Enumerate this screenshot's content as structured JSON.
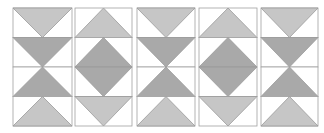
{
  "diagram": {
    "title": "",
    "colors": {
      "background": "#ffffff",
      "light": "#c6c6c6",
      "dark": "#a9a9a9",
      "stroke": "#9a9a9a",
      "frame": "#a0a0a0"
    },
    "row_top": 8,
    "row_height": 29.5,
    "columns": [
      {
        "x": 13,
        "w": 59,
        "tiles": [
          "down-light",
          "down-dark",
          "up-dark",
          "up-light"
        ]
      },
      {
        "x": 75,
        "w": 57,
        "tiles": [
          "up-light",
          "up-dark",
          "down-dark",
          "down-light"
        ]
      },
      {
        "x": 137,
        "w": 58,
        "tiles": [
          "down-light",
          "down-dark",
          "up-dark",
          "up-light"
        ]
      },
      {
        "x": 199,
        "w": 58,
        "tiles": [
          "up-light",
          "up-dark",
          "down-dark",
          "down-light"
        ]
      },
      {
        "x": 261,
        "w": 57,
        "tiles": [
          "down-light",
          "down-dark",
          "up-dark",
          "up-light"
        ]
      }
    ]
  }
}
